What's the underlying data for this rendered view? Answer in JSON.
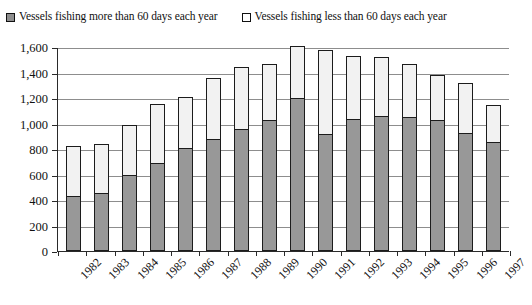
{
  "legend": {
    "items": [
      {
        "label": "Vessels fishing more than 60 days each year",
        "swatch": "filled-gray-square-icon",
        "color": "#989898"
      },
      {
        "label": "Vessels fishing less than 60 days each year",
        "swatch": "open-white-square-icon",
        "color": "#ffffff"
      }
    ]
  },
  "chart_data": {
    "type": "bar",
    "subtype": "stacked",
    "title": "",
    "xlabel": "",
    "ylabel": "",
    "ylim": [
      0,
      1600
    ],
    "ytick_step": 200,
    "ytick_labels": [
      "0",
      "200",
      "400",
      "600",
      "800",
      "1,000",
      "1,200",
      "1,400",
      "1,600"
    ],
    "ytick_values": [
      0,
      200,
      400,
      600,
      800,
      1000,
      1200,
      1400,
      1600
    ],
    "grid": "horizontal",
    "legend_position": "top-left",
    "categories": [
      "1982",
      "1983",
      "1984",
      "1985",
      "1986",
      "1987",
      "1988",
      "1989",
      "1990",
      "1991",
      "1992",
      "1993",
      "1994",
      "1995",
      "1996",
      "1997"
    ],
    "series": [
      {
        "name": "Vessels fishing more than 60 days each year",
        "color": "#989898",
        "values": [
          420,
          450,
          590,
          680,
          800,
          870,
          950,
          1020,
          1190,
          910,
          1030,
          1050,
          1045,
          1020,
          920,
          845
        ]
      },
      {
        "name": "Vessels fishing less than 60 days each year",
        "color": "#f2f2f2",
        "values": [
          400,
          390,
          400,
          470,
          410,
          485,
          490,
          450,
          420,
          670,
          500,
          475,
          425,
          360,
          400,
          300
        ]
      }
    ],
    "totals": [
      820,
      840,
      990,
      1150,
      1210,
      1355,
      1440,
      1470,
      1610,
      1580,
      1530,
      1525,
      1470,
      1380,
      1320,
      1145
    ]
  }
}
